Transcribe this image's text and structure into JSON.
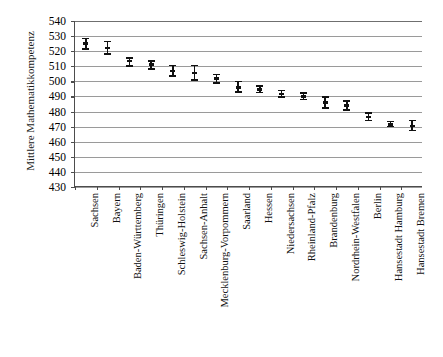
{
  "chart_data": {
    "type": "scatter",
    "title": "",
    "xlabel": "",
    "ylabel": "Mittlere Mathematikkompetenz",
    "ylim": [
      430,
      540
    ],
    "ytick_step": 10,
    "yticks": [
      540,
      530,
      520,
      510,
      500,
      490,
      480,
      470,
      460,
      450,
      440,
      430
    ],
    "grid": "horizontal",
    "legend": "none",
    "error_bars": true,
    "marker": "point-with-error-bar",
    "categories": [
      "Sachsen",
      "Bayern",
      "Baden-Württemberg",
      "Thüringen",
      "Schleswig-Holstein",
      "Sachsen-Anhalt",
      "Mecklenburg-Vorpommern",
      "Saarland",
      "Hessen",
      "Niedersachsen",
      "Rheinland-Pfalz",
      "Brandenburg",
      "Nordrhein-Westfalen",
      "Berlin",
      "Hansestadt Hamburg",
      "Hansestadt Bremen"
    ],
    "values": [
      525,
      522,
      513.5,
      511,
      507,
      505.5,
      502,
      496,
      494.5,
      491.5,
      490,
      486,
      484,
      476.5,
      471.5,
      470.5
    ],
    "ci_low": [
      521,
      517.5,
      509.5,
      507.5,
      503,
      500.5,
      498.5,
      492.5,
      492,
      489,
      487.5,
      482,
      480.5,
      473.5,
      469.5,
      467
    ],
    "ci_high": [
      529,
      527,
      516,
      514,
      511,
      511,
      505,
      500.5,
      497.5,
      494.5,
      493,
      490,
      487.5,
      479.5,
      474,
      474.5
    ],
    "series": [
      {
        "name": "Mittlere Mathematikkompetenz",
        "values": [
          525,
          522,
          513.5,
          511,
          507,
          505.5,
          502,
          496,
          494.5,
          491.5,
          490,
          486,
          484,
          476.5,
          471.5,
          470.5
        ]
      }
    ],
    "colors": {
      "marker": "#111111",
      "gridline": "#9a9a9a",
      "axis": "#4d4d4d",
      "background": "#ffffff"
    }
  }
}
